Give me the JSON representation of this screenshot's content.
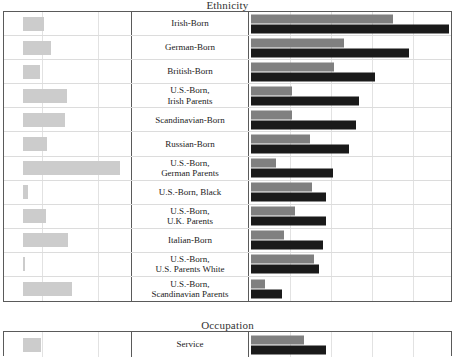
{
  "sections": [
    {
      "id": "ethnicity",
      "title": "Ethnicity",
      "rows": [
        {
          "label_line1": "Irish-Born",
          "label_line2": "",
          "left": 21,
          "gray": 142,
          "black": 198
        },
        {
          "label_line1": "German-Born",
          "label_line2": "",
          "left": 28,
          "gray": 93,
          "black": 158
        },
        {
          "label_line1": "British-Born",
          "label_line2": "",
          "left": 17,
          "gray": 83,
          "black": 124
        },
        {
          "label_line1": "U.S.-Born,",
          "label_line2": "Irish Parents",
          "left": 44,
          "gray": 41,
          "black": 108
        },
        {
          "label_line1": "Scandinavian-Born",
          "label_line2": "",
          "left": 42,
          "gray": 41,
          "black": 105
        },
        {
          "label_line1": "Russian-Born",
          "label_line2": "",
          "left": 24,
          "gray": 59,
          "black": 98
        },
        {
          "label_line1": "U.S.-Born,",
          "label_line2": "German Parents",
          "left": 97,
          "gray": 25,
          "black": 82
        },
        {
          "label_line1": "U.S.-Born, Black",
          "label_line2": "",
          "left": 5,
          "gray": 61,
          "black": 75
        },
        {
          "label_line1": "U.S.-Born,",
          "label_line2": "U.K. Parents",
          "left": 23,
          "gray": 44,
          "black": 75
        },
        {
          "label_line1": "Italian-Born",
          "label_line2": "",
          "left": 45,
          "gray": 33,
          "black": 72
        },
        {
          "label_line1": "U.S.-Born,",
          "label_line2": "U.S. Parents White",
          "left": 2,
          "gray": 63,
          "black": 68
        },
        {
          "label_line1": "U.S.-Born,",
          "label_line2": "Scandinavian Parents",
          "left": 49,
          "gray": 14,
          "black": 31
        }
      ]
    },
    {
      "id": "occupation",
      "title": "Occupation",
      "rows": [
        {
          "label_line1": "Service",
          "label_line2": "",
          "left": 18,
          "gray": 53,
          "black": 75
        }
      ]
    }
  ],
  "chart_data": {
    "type": "bar",
    "layout": "Two stacked panels; each row has a small left-hand single gray bar chart, a centered category label, and a right-hand grouped pair of bars (upper gray, lower black).",
    "grid": true,
    "legend_position": "none",
    "panels": [
      {
        "title": "Ethnicity",
        "categories": [
          "Irish-Born",
          "German-Born",
          "British-Born",
          "U.S.-Born, Irish Parents",
          "Scandinavian-Born",
          "Russian-Born",
          "U.S.-Born, German Parents",
          "U.S.-Born, Black",
          "U.S.-Born, U.K. Parents",
          "Italian-Born",
          "U.S.-Born, U.S. Parents White",
          "U.S.-Born, Scandinavian Parents"
        ],
        "left_chart": {
          "series_name": "left-panel value",
          "color": "#cccccc",
          "values_px": [
            21,
            28,
            17,
            44,
            42,
            24,
            97,
            5,
            23,
            45,
            2,
            49
          ]
        },
        "right_chart": {
          "series": [
            {
              "name": "gray series",
              "color": "#808080",
              "values_px": [
                142,
                93,
                83,
                41,
                41,
                59,
                25,
                61,
                44,
                33,
                63,
                14
              ]
            },
            {
              "name": "black series",
              "color": "#1a1a1a",
              "values_px": [
                198,
                158,
                124,
                108,
                105,
                98,
                82,
                75,
                75,
                72,
                68,
                31
              ]
            }
          ]
        }
      },
      {
        "title": "Occupation",
        "categories": [
          "Service"
        ],
        "left_chart": {
          "series_name": "left-panel value",
          "color": "#cccccc",
          "values_px": [
            18
          ]
        },
        "right_chart": {
          "series": [
            {
              "name": "gray series",
              "color": "#808080",
              "values_px": [
                53
              ]
            },
            {
              "name": "black series",
              "color": "#1a1a1a",
              "values_px": [
                75
              ]
            }
          ]
        }
      }
    ]
  },
  "colors": {
    "left_bar": "#cccccc",
    "gray_bar": "#808080",
    "black_bar": "#1a1a1a",
    "frame": "#5a5a5a",
    "gridline": "#e2e2e2"
  }
}
